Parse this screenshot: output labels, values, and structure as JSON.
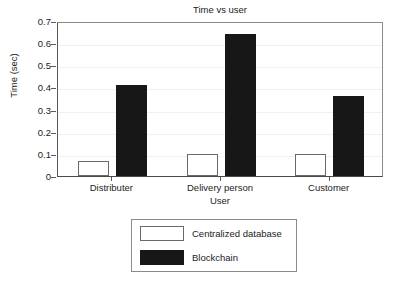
{
  "chart_data": {
    "type": "bar",
    "title": "Time vs user",
    "xlabel": "User",
    "ylabel": "Time (sec)",
    "categories": [
      "Distributer",
      "Delivery person",
      "Customer"
    ],
    "series": [
      {
        "name": "Centralized database",
        "color": "#ffffff",
        "edge_color": "#6a6a6a",
        "values": [
          0.07,
          0.1,
          0.1
        ]
      },
      {
        "name": "Blockchain",
        "color": "#171717",
        "edge_color": "#171717",
        "values": [
          0.41,
          0.64,
          0.36
        ]
      }
    ],
    "ylim": [
      0,
      0.7
    ],
    "yticks": [
      0,
      0.1,
      0.2,
      0.3,
      0.4,
      0.5,
      0.6,
      0.7
    ],
    "ytick_labels": [
      "0",
      "0.1",
      "0.2",
      "0.3",
      "0.4",
      "0.5",
      "0.6",
      "0.7"
    ],
    "grid": true,
    "grid_axis": "y",
    "grid_color": "#f0f0f0",
    "legend_position": "below-axes-center",
    "background": "#ffffff",
    "axis_color": "#5a5a5a"
  }
}
